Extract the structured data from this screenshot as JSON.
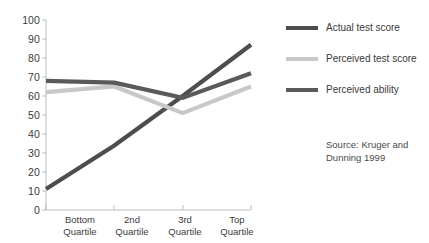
{
  "chart_data": {
    "type": "line",
    "title": "",
    "xlabel": "",
    "ylabel": "",
    "categories": [
      "Bottom Quartile",
      "2nd Quartile",
      "3rd Quartile",
      "Top Quartile"
    ],
    "categories_lines": [
      [
        "Bottom",
        "Quartile"
      ],
      [
        "2nd",
        "Quartile"
      ],
      [
        "3rd",
        "Quartile"
      ],
      [
        "Top",
        "Quartile"
      ]
    ],
    "ylim": [
      0,
      100
    ],
    "yticks": [
      0,
      10,
      20,
      30,
      40,
      50,
      60,
      70,
      80,
      90,
      100
    ],
    "grid": false,
    "legend_position": "right",
    "series": [
      {
        "name": "Actual test score",
        "color": "#4d4d4d",
        "values": [
          11,
          34,
          60,
          87
        ]
      },
      {
        "name": "Perceived test score",
        "color": "#c8c8c8",
        "values": [
          62,
          65,
          51,
          65
        ]
      },
      {
        "name": "Perceived ability",
        "color": "#5a5a5a",
        "values": [
          68,
          67,
          59,
          72
        ]
      }
    ],
    "annotations": [
      "Source: Kruger and Dunning 1999"
    ]
  },
  "axis": {
    "y_tick_labels": [
      "100",
      "90",
      "80",
      "70",
      "60",
      "50",
      "40",
      "30",
      "20",
      "10",
      "0"
    ],
    "axis_color": "#bdbdbd"
  },
  "legend": {
    "items": [
      {
        "label": "Actual test score",
        "color": "#4d4d4d"
      },
      {
        "label": "Perceived test score",
        "color": "#c8c8c8"
      },
      {
        "label": "Perceived ability",
        "color": "#5a5a5a"
      }
    ]
  },
  "source": {
    "line1": "Source: Kruger and",
    "line2": "Dunning 1999"
  }
}
